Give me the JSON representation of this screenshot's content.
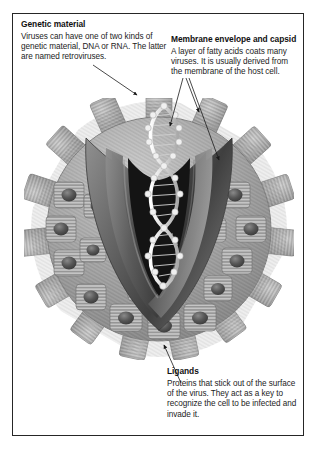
{
  "figure": {
    "border_color": "#262626",
    "background_color": "#ffffff"
  },
  "callouts": [
    {
      "id": "genetic-material",
      "title": "Genetic material",
      "body": "Viruses can have one of two kinds of genetic material, DNA or RNA. The latter are named retroviruses."
    },
    {
      "id": "membrane-envelope-capsid",
      "title": "Membrane envelope and capsid",
      "body": "A layer of fatty acids coats many viruses. It is usually derived from the membrane of the host cell."
    },
    {
      "id": "ligands",
      "title": "Ligands",
      "body": "Proteins that stick out of the surface of the virus. They act as a key to recognize the cell to be infected and invade it."
    }
  ],
  "illustration": {
    "name": "virus-particle",
    "parts": [
      "ligand-spikes",
      "membrane-envelope",
      "capsid",
      "dna-double-helix"
    ],
    "palette": {
      "spike_light": "#cfcfcf",
      "spike_mid": "#9a9a9a",
      "spike_dark": "#6b6b6b",
      "envelope_mid": "#8f8f8f",
      "envelope_dark": "#545454",
      "capsid_dark": "#2a2a2a",
      "core_black": "#141414",
      "helix_light": "#efefef"
    }
  }
}
